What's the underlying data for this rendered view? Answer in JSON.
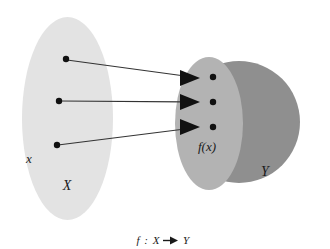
{
  "figure": {
    "caption": {
      "function_symbol": "f",
      "colon": ":",
      "domain_symbol": "X",
      "arrow": "→",
      "codomain_symbol": "Y",
      "full_text": "f : X → Y"
    },
    "background_color": "#ffffff"
  },
  "domain_set": {
    "name": "domain-ellipse",
    "label_upper": "X",
    "label_lower": "x",
    "fill_color": "#e3e3e3",
    "shape": "ellipse",
    "center": {
      "cx": 67.5,
      "cy": 118.5
    },
    "radii": {
      "rx": 45.5,
      "ry": 101.5
    },
    "label_upper_pos": {
      "x": 67,
      "y": 190
    },
    "label_lower_pos": {
      "x": 29,
      "y": 163
    },
    "elements": [
      {
        "id": "domain-point-1",
        "cx": 66,
        "cy": 59,
        "r": 3.2
      },
      {
        "id": "domain-point-2",
        "cx": 59,
        "cy": 101,
        "r": 3.2
      },
      {
        "id": "domain-point-3",
        "cx": 57,
        "cy": 145,
        "r": 3.2
      }
    ]
  },
  "codomain_set": {
    "name": "codomain-circle",
    "label": "Y",
    "fill_color": "#8f8f8f",
    "shape": "circle",
    "center": {
      "cx": 239,
      "cy": 122
    },
    "radius": 61,
    "label_pos": {
      "x": 265,
      "y": 176
    }
  },
  "image_set": {
    "name": "image-ellipse",
    "label": "f(x)",
    "fill_color": "#b3b3b3",
    "shape": "ellipse",
    "center": {
      "cx": 209,
      "cy": 123.5
    },
    "radii": {
      "rx": 34,
      "ry": 66.5
    },
    "label_pos": {
      "x": 207,
      "y": 151
    },
    "elements": [
      {
        "id": "image-point-1",
        "cx": 213,
        "cy": 77,
        "r": 3.2
      },
      {
        "id": "image-point-2",
        "cx": 213,
        "cy": 102,
        "r": 3.2
      },
      {
        "id": "image-point-3",
        "cx": 213,
        "cy": 127,
        "r": 3.2
      }
    ]
  },
  "mappings": [
    {
      "id": "mapping-arrow-1",
      "from": {
        "x": 67,
        "y": 60
      },
      "to": {
        "x": 200,
        "y": 78
      },
      "tail_end": {
        "x": 183,
        "y": 75.7
      },
      "stroke_color": "#333333",
      "stroke_width": 1.1
    },
    {
      "id": "mapping-arrow-2",
      "from": {
        "x": 60,
        "y": 101
      },
      "to": {
        "x": 200,
        "y": 102
      },
      "tail_end": {
        "x": 183,
        "y": 101.9
      },
      "stroke_color": "#333333",
      "stroke_width": 1.1
    },
    {
      "id": "mapping-arrow-3",
      "from": {
        "x": 58,
        "y": 145
      },
      "to": {
        "x": 200,
        "y": 127
      },
      "tail_end": {
        "x": 183,
        "y": 129.2
      },
      "stroke_color": "#333333",
      "stroke_width": 1.1
    }
  ],
  "style": {
    "point_color": "#111111",
    "arrowhead_color": "#111111",
    "label_color": "#1a1a1a",
    "label_font_size": 13,
    "image_label_font_size": 13,
    "caption_font_size": 11
  }
}
